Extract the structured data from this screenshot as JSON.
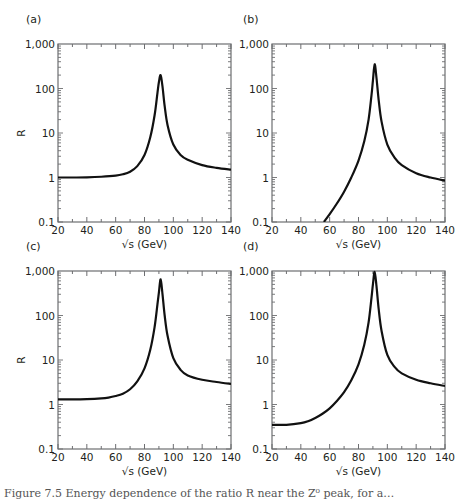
{
  "figure": {
    "caption_fragment": "Figure 7.5  Energy dependence of the ratio R near the Z⁰ peak, for a…"
  },
  "chart_data": [
    {
      "panel": "(a)",
      "type": "line",
      "title": "(a)",
      "xlabel": "√s (GeV)",
      "ylabel": "R",
      "xlim": [
        20,
        140
      ],
      "ylim": [
        0.1,
        1000
      ],
      "yscale": "log",
      "xticks": [
        20,
        40,
        60,
        80,
        100,
        120,
        140
      ],
      "yticks": [
        "0.1",
        "1",
        "10",
        "100",
        "1,000"
      ],
      "x": [
        20,
        30,
        40,
        50,
        60,
        65,
        70,
        75,
        80,
        84,
        87,
        89,
        90,
        91.2,
        92.5,
        94,
        96,
        100,
        105,
        110,
        120,
        130,
        140
      ],
      "values": [
        1.0,
        1.0,
        1.01,
        1.04,
        1.1,
        1.18,
        1.35,
        1.8,
        3.2,
        8,
        25,
        80,
        140,
        200,
        110,
        40,
        15,
        5.5,
        3.2,
        2.5,
        1.9,
        1.65,
        1.5
      ]
    },
    {
      "panel": "(b)",
      "type": "line",
      "title": "(b)",
      "xlabel": "√s (GeV)",
      "ylabel": "",
      "xlim": [
        20,
        140
      ],
      "ylim": [
        0.1,
        1000
      ],
      "yscale": "log",
      "xticks": [
        20,
        40,
        60,
        80,
        100,
        120,
        140
      ],
      "yticks": [
        "0.1",
        "1",
        "10",
        "100",
        "1,000"
      ],
      "x": [
        56,
        60,
        65,
        70,
        75,
        80,
        84,
        87,
        89,
        90,
        91.2,
        92.5,
        94,
        96,
        100,
        105,
        110,
        120,
        130,
        140
      ],
      "values": [
        0.1,
        0.15,
        0.26,
        0.48,
        1.0,
        2.4,
        6.5,
        20,
        70,
        150,
        350,
        170,
        55,
        18,
        5.5,
        2.8,
        1.9,
        1.25,
        1.0,
        0.85
      ]
    },
    {
      "panel": "(c)",
      "type": "line",
      "title": "(c)",
      "xlabel": "√s (GeV)",
      "ylabel": "R",
      "xlim": [
        20,
        140
      ],
      "ylim": [
        0.1,
        1000
      ],
      "yscale": "log",
      "xticks": [
        20,
        40,
        60,
        80,
        100,
        120,
        140
      ],
      "yticks": [
        "0.1",
        "1",
        "10",
        "100",
        "1,000"
      ],
      "x": [
        20,
        30,
        40,
        50,
        55,
        60,
        65,
        70,
        75,
        80,
        84,
        87,
        89,
        90,
        91.2,
        92.5,
        94,
        96,
        100,
        105,
        110,
        120,
        130,
        140
      ],
      "values": [
        1.3,
        1.3,
        1.32,
        1.37,
        1.43,
        1.55,
        1.75,
        2.2,
        3.3,
        6.5,
        17,
        55,
        180,
        330,
        650,
        300,
        100,
        35,
        11,
        6.0,
        4.5,
        3.6,
        3.2,
        2.9
      ]
    },
    {
      "panel": "(d)",
      "type": "line",
      "title": "(d)",
      "xlabel": "√s (GeV)",
      "ylabel": "",
      "xlim": [
        20,
        140
      ],
      "ylim": [
        0.1,
        1000
      ],
      "yscale": "log",
      "xticks": [
        20,
        40,
        60,
        80,
        100,
        120,
        140
      ],
      "yticks": [
        "0.1",
        "1",
        "10",
        "100",
        "1,000"
      ],
      "x": [
        20,
        30,
        40,
        45,
        50,
        55,
        60,
        65,
        70,
        75,
        80,
        84,
        87,
        89,
        90,
        91.2,
        92.5,
        94,
        96,
        100,
        105,
        110,
        120,
        130,
        140
      ],
      "values": [
        0.35,
        0.35,
        0.38,
        0.42,
        0.5,
        0.62,
        0.82,
        1.2,
        1.9,
        3.5,
        8,
        22,
        70,
        250,
        500,
        950,
        450,
        140,
        45,
        13,
        7,
        5.0,
        3.6,
        3.0,
        2.6
      ]
    }
  ],
  "layout": {
    "panels": [
      {
        "left": 58,
        "top": 44,
        "width": 173,
        "height": 178,
        "label_x": 26,
        "label_y": 23
      },
      {
        "left": 272,
        "top": 44,
        "width": 173,
        "height": 178,
        "label_x": 243,
        "label_y": 23
      },
      {
        "left": 58,
        "top": 271,
        "width": 173,
        "height": 178,
        "label_x": 26,
        "label_y": 250
      },
      {
        "left": 272,
        "top": 271,
        "width": 173,
        "height": 178,
        "label_x": 243,
        "label_y": 250
      }
    ],
    "line_color": "#111111",
    "axis_color": "#6d6e71"
  }
}
